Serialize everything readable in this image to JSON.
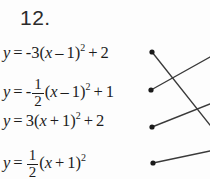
{
  "problem": {
    "number": "12."
  },
  "equations": [
    {
      "id": "equation-1",
      "text": "y = -3(x – 1)² + 2",
      "lhs": "y",
      "equals": "=",
      "coefficient": "-3",
      "open_paren": "(",
      "inner_var": "x",
      "inner_op": "–",
      "inner_const": "1",
      "close_paren": ")",
      "exponent": "2",
      "tail_op": "+",
      "tail_const": "2",
      "has_fraction": false
    },
    {
      "id": "equation-2",
      "text": "y = -1/2(x – 1)² + 1",
      "lhs": "y",
      "equals": "=",
      "coefficient": "-",
      "frac_num": "1",
      "frac_den": "2",
      "open_paren": "(",
      "inner_var": "x",
      "inner_op": "–",
      "inner_const": "1",
      "close_paren": ")",
      "exponent": "2",
      "tail_op": "+",
      "tail_const": "1",
      "has_fraction": true
    },
    {
      "id": "equation-3",
      "text": "y = 3(x + 1)² + 2",
      "lhs": "y",
      "equals": "=",
      "coefficient": "3",
      "open_paren": "(",
      "inner_var": "x",
      "inner_op": "+",
      "inner_const": "1",
      "close_paren": ")",
      "exponent": "2",
      "tail_op": "+",
      "tail_const": "2",
      "has_fraction": false
    },
    {
      "id": "equation-4",
      "text": "y = 1/2(x + 1)²",
      "lhs": "y",
      "equals": "=",
      "coefficient": "",
      "frac_num": "1",
      "frac_den": "2",
      "open_paren": "(",
      "inner_var": "x",
      "inner_op": "+",
      "inner_const": "1",
      "close_paren": ")",
      "exponent": "2",
      "tail_op": "",
      "tail_const": "",
      "has_fraction": true
    }
  ],
  "connectors": {
    "dot_radius": 2.6,
    "dots": [
      {
        "name": "match-dot-1",
        "x": 152,
        "y": 52
      },
      {
        "name": "match-dot-2",
        "x": 151,
        "y": 90
      },
      {
        "name": "match-dot-3",
        "x": 152,
        "y": 127
      },
      {
        "name": "match-dot-4",
        "x": 153,
        "y": 163
      }
    ],
    "lines": [
      {
        "name": "match-line-1",
        "x1": 152,
        "y1": 52,
        "x2": 210,
        "y2": 125
      },
      {
        "name": "match-line-2",
        "x1": 151,
        "y1": 90,
        "x2": 210,
        "y2": 57
      },
      {
        "name": "match-line-3",
        "x1": 152,
        "y1": 127,
        "x2": 210,
        "y2": 104
      },
      {
        "name": "match-line-4",
        "x1": 153,
        "y1": 163,
        "x2": 210,
        "y2": 151
      }
    ]
  },
  "colors": {
    "ink": "#1c1c1c",
    "line": "#3a3a3a",
    "background": "#fdfdfd"
  }
}
